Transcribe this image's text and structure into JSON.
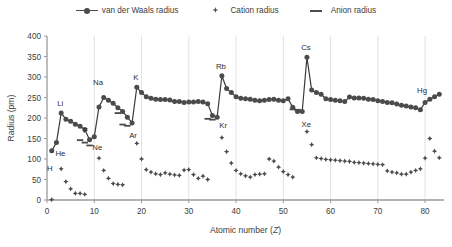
{
  "legend": {
    "position": "top-center",
    "entries": [
      {
        "label": "van der Waals radius",
        "glyph": "line-circle-marker-icon"
      },
      {
        "label": "Cation radius",
        "glyph": "diamond-marker-icon"
      },
      {
        "label": "Anion radius",
        "glyph": "dash-marker-icon"
      }
    ]
  },
  "axes": {
    "x_title": "Atomic number (",
    "x_title_italic": "Z",
    "x_title_close": ")",
    "y_title": "Radius (pm)",
    "x_ticks": [
      "0",
      "10",
      "20",
      "30",
      "40",
      "50",
      "60",
      "70",
      "80"
    ],
    "y_ticks": [
      "0",
      "50",
      "100",
      "150",
      "200",
      "250",
      "300",
      "350",
      "400"
    ]
  },
  "chart_data": {
    "type": "line",
    "title": "",
    "subtitle": "",
    "xlabel": "Atomic number (Z)",
    "ylabel": "Radius (pm)",
    "xlim": [
      0,
      84
    ],
    "ylim": [
      0,
      400
    ],
    "xtick_step": 10,
    "ytick_step": 50,
    "grid": "vertical-only",
    "legend_position": "top-center",
    "colors": {
      "marker": "#4b4b4b",
      "line": "#3a3a3a",
      "grid": "#d9d9d9",
      "axis": "#a6a6a6"
    },
    "annotations": [
      {
        "text": "H",
        "x": 1,
        "y": 120,
        "dx": -2,
        "dy": 20
      },
      {
        "text": "He",
        "x": 2,
        "y": 140,
        "dx": 4,
        "dy": 13
      },
      {
        "text": "Li",
        "x": 3,
        "y": 212,
        "dx": -1,
        "dy": -7
      },
      {
        "text": "F",
        "x": 9,
        "y": 147,
        "dx": -4,
        "dy": -7
      },
      {
        "text": "Ne",
        "x": 10,
        "y": 154,
        "dx": 3,
        "dy": 13
      },
      {
        "text": "Na",
        "x": 11,
        "y": 227,
        "dx": -1,
        "dy": -22
      },
      {
        "text": "Ar",
        "x": 18,
        "y": 188,
        "dx": 1,
        "dy": 15
      },
      {
        "text": "K",
        "x": 19,
        "y": 275,
        "dx": -1,
        "dy": -7
      },
      {
        "text": "Kr",
        "x": 36,
        "y": 202,
        "dx": 6,
        "dy": 11
      },
      {
        "text": "Rb",
        "x": 37,
        "y": 303,
        "dx": -1,
        "dy": -7
      },
      {
        "text": "Xe",
        "x": 54,
        "y": 216,
        "dx": 4,
        "dy": 16
      },
      {
        "text": "Cs",
        "x": 55,
        "y": 348,
        "dx": -1,
        "dy": -7
      },
      {
        "text": "Hg",
        "x": 80,
        "y": 238,
        "dx": -3,
        "dy": -9
      }
    ],
    "series": [
      {
        "name": "van der Waals radius",
        "marker": "circle",
        "connected": true,
        "points": [
          [
            1,
            120
          ],
          [
            2,
            140
          ],
          [
            3,
            212
          ],
          [
            4,
            197
          ],
          [
            5,
            192
          ],
          [
            6,
            185
          ],
          [
            7,
            180
          ],
          [
            8,
            172
          ],
          [
            9,
            147
          ],
          [
            10,
            154
          ],
          [
            11,
            227
          ],
          [
            12,
            250
          ],
          [
            13,
            243
          ],
          [
            14,
            236
          ],
          [
            15,
            225
          ],
          [
            16,
            216
          ],
          [
            17,
            202
          ],
          [
            18,
            188
          ],
          [
            19,
            275
          ],
          [
            20,
            262
          ],
          [
            21,
            252
          ],
          [
            22,
            248
          ],
          [
            23,
            246
          ],
          [
            24,
            245
          ],
          [
            25,
            245
          ],
          [
            26,
            244
          ],
          [
            27,
            240
          ],
          [
            28,
            240
          ],
          [
            29,
            238
          ],
          [
            30,
            239
          ],
          [
            31,
            239
          ],
          [
            32,
            240
          ],
          [
            33,
            239
          ],
          [
            34,
            235
          ],
          [
            35,
            206
          ],
          [
            36,
            202
          ],
          [
            37,
            303
          ],
          [
            38,
            272
          ],
          [
            39,
            262
          ],
          [
            40,
            252
          ],
          [
            41,
            248
          ],
          [
            42,
            247
          ],
          [
            43,
            246
          ],
          [
            44,
            243
          ],
          [
            45,
            242
          ],
          [
            46,
            243
          ],
          [
            47,
            245
          ],
          [
            48,
            246
          ],
          [
            49,
            243
          ],
          [
            50,
            242
          ],
          [
            51,
            247
          ],
          [
            52,
            226
          ],
          [
            53,
            216
          ],
          [
            54,
            216
          ],
          [
            55,
            348
          ],
          [
            56,
            268
          ],
          [
            57,
            262
          ],
          [
            58,
            258
          ],
          [
            59,
            247
          ],
          [
            60,
            245
          ],
          [
            61,
            243
          ],
          [
            62,
            242
          ],
          [
            63,
            240
          ],
          [
            64,
            251
          ],
          [
            65,
            249
          ],
          [
            66,
            249
          ],
          [
            67,
            248
          ],
          [
            68,
            246
          ],
          [
            69,
            245
          ],
          [
            70,
            242
          ],
          [
            71,
            240
          ],
          [
            72,
            238
          ],
          [
            73,
            237
          ],
          [
            74,
            234
          ],
          [
            75,
            231
          ],
          [
            76,
            229
          ],
          [
            77,
            227
          ],
          [
            78,
            225
          ],
          [
            79,
            220
          ],
          [
            80,
            238
          ],
          [
            81,
            246
          ],
          [
            82,
            252
          ],
          [
            83,
            258
          ]
        ]
      },
      {
        "name": "Cation radius",
        "marker": "diamond",
        "connected": false,
        "points": [
          [
            1,
            1
          ],
          [
            3,
            76
          ],
          [
            4,
            45
          ],
          [
            5,
            27
          ],
          [
            6,
            16
          ],
          [
            7,
            16
          ],
          [
            8,
            14
          ],
          [
            11,
            102
          ],
          [
            12,
            72
          ],
          [
            13,
            53
          ],
          [
            14,
            40
          ],
          [
            15,
            38
          ],
          [
            16,
            37
          ],
          [
            19,
            138
          ],
          [
            20,
            100
          ],
          [
            21,
            74
          ],
          [
            22,
            68
          ],
          [
            23,
            64
          ],
          [
            24,
            62
          ],
          [
            25,
            66
          ],
          [
            26,
            63
          ],
          [
            27,
            61
          ],
          [
            28,
            60
          ],
          [
            29,
            73
          ],
          [
            30,
            74
          ],
          [
            31,
            62
          ],
          [
            32,
            53
          ],
          [
            33,
            58
          ],
          [
            34,
            50
          ],
          [
            37,
            152
          ],
          [
            38,
            118
          ],
          [
            39,
            90
          ],
          [
            40,
            72
          ],
          [
            41,
            64
          ],
          [
            42,
            59
          ],
          [
            43,
            56
          ],
          [
            44,
            62
          ],
          [
            45,
            63
          ],
          [
            46,
            64
          ],
          [
            47,
            100
          ],
          [
            48,
            95
          ],
          [
            49,
            80
          ],
          [
            50,
            69
          ],
          [
            51,
            62
          ],
          [
            52,
            56
          ],
          [
            55,
            167
          ],
          [
            56,
            135
          ],
          [
            57,
            103
          ],
          [
            58,
            101
          ],
          [
            59,
            99
          ],
          [
            60,
            98
          ],
          [
            61,
            97
          ],
          [
            62,
            96
          ],
          [
            63,
            95
          ],
          [
            64,
            94
          ],
          [
            65,
            92
          ],
          [
            66,
            91
          ],
          [
            67,
            90
          ],
          [
            68,
            89
          ],
          [
            69,
            88
          ],
          [
            70,
            87
          ],
          [
            71,
            86
          ],
          [
            72,
            71
          ],
          [
            73,
            68
          ],
          [
            74,
            66
          ],
          [
            75,
            63
          ],
          [
            76,
            63
          ],
          [
            77,
            68
          ],
          [
            78,
            72
          ],
          [
            79,
            76
          ],
          [
            80,
            102
          ],
          [
            81,
            150
          ],
          [
            82,
            119
          ],
          [
            83,
            103
          ]
        ]
      },
      {
        "name": "Anion radius",
        "marker": "dash",
        "connected": false,
        "points": [
          [
            7,
            146
          ],
          [
            8,
            140
          ],
          [
            9,
            133
          ],
          [
            15,
            212
          ],
          [
            16,
            184
          ],
          [
            17,
            181
          ],
          [
            34,
            198
          ],
          [
            35,
            196
          ],
          [
            52,
            221
          ],
          [
            53,
            220
          ]
        ]
      }
    ]
  }
}
